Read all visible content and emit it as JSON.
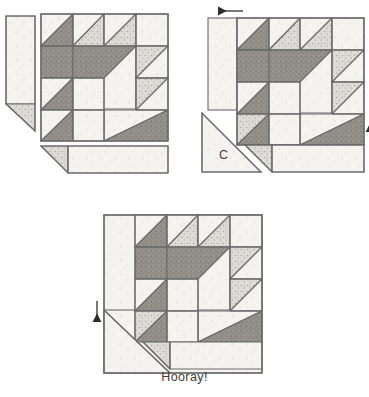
{
  "diagram": {
    "type": "quilt-block-assembly",
    "caption": "Hooray!",
    "piece_labels": {
      "corner_triangle": "C"
    },
    "colors": {
      "outline": "#6b6b6b",
      "light": "#f4f3f0",
      "medium": "#d9d8d2",
      "dark": "#8f8d86",
      "arrow": "#2e2e2e",
      "background": "#ffffff"
    },
    "fabrics": [
      {
        "name": "light",
        "hex": "#f4f3f0",
        "description": "light speckled background"
      },
      {
        "name": "medium",
        "hex": "#d9d8d2",
        "description": "medium speckled accent"
      },
      {
        "name": "dark",
        "hex": "#8f8d86",
        "description": "dark textured leaf"
      }
    ],
    "steps": [
      {
        "id": "step-1",
        "name": "attach-side-and-bottom-strips",
        "description": "Block centre with side strip at left and bottom strip below, both with angled medium ends",
        "loose_pieces": [
          "left-side-strip",
          "bottom-strip"
        ],
        "arrows": []
      },
      {
        "id": "step-2",
        "name": "strips-sewn-corner-triangle-added",
        "description": "Strips sewn to block, corner triangle C positioned at lower left",
        "loose_pieces": [
          "corner-triangle-c"
        ],
        "arrows": [
          {
            "name": "top-arrow",
            "direction": "left",
            "position": "top-edge"
          },
          {
            "name": "right-arrow",
            "direction": "down",
            "position": "right-edge"
          }
        ]
      },
      {
        "id": "step-3",
        "name": "completed-block",
        "description": "Finished block with all strips and corner triangle attached",
        "loose_pieces": [],
        "arrows": [
          {
            "name": "left-arrow",
            "direction": "down",
            "position": "left-edge"
          }
        ]
      }
    ]
  }
}
